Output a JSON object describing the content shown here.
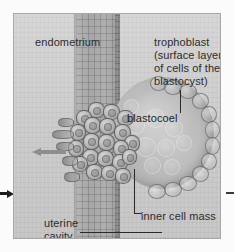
{
  "figure": {
    "name": "blastocyst-implantation-diagram",
    "panel": {
      "background_color": "#cfcfcf",
      "border_color": "#a8a8a8"
    }
  },
  "labels": {
    "endometrium": "endometrium",
    "trophoblast": "trophoblast\n(surface layer\nof cells of the\nblastocyst)",
    "blastocoel": "blastocoel",
    "inner_cell_mass": "inner cell mass",
    "uterine_cavity": "uterine\ncavity"
  },
  "structures": [
    {
      "name": "endometrium",
      "description": "columnar epithelial tissue band"
    },
    {
      "name": "trophoblast",
      "description": "surface layer of cells of the blastocyst"
    },
    {
      "name": "blastocoel",
      "description": "fluid-filled cavity of the blastocyst"
    },
    {
      "name": "inner-cell-mass",
      "description": "dense cluster of embryonic cells"
    },
    {
      "name": "uterine-cavity",
      "description": "space adjacent to the endometrium"
    }
  ],
  "annotations": {
    "arrow_inner_direction": "left",
    "arrow_outer_direction": "right",
    "leader_lines": 4
  },
  "colors": {
    "text": "#2c2c2c",
    "leader": "#2a2a2a",
    "arrow_inner": "#8e8e8e",
    "arrow_outer": "#1e1e1e",
    "tissue": "#ababab",
    "blastocyst": "#b3b3b3"
  }
}
